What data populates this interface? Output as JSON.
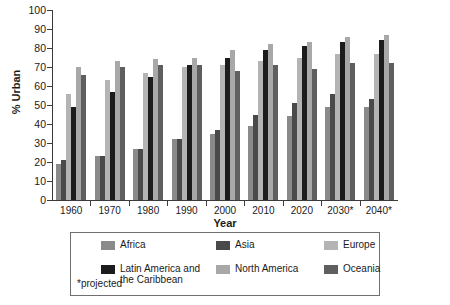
{
  "chart_data": {
    "type": "bar",
    "title": "",
    "subtitle": "",
    "xlabel": "Year",
    "ylabel": "% Urban",
    "ylim": [
      0,
      100
    ],
    "ytick_step": 10,
    "yticks": [
      "100",
      "90",
      "80",
      "70",
      "60",
      "50",
      "40",
      "30",
      "20",
      "10",
      "0"
    ],
    "grid": false,
    "legend_position": "below-boxed",
    "categories": [
      "1960",
      "1970",
      "1980",
      "1990",
      "2000",
      "2010",
      "2020",
      "2030*",
      "2040*"
    ],
    "series": [
      {
        "name": "Africa",
        "color": "#8a8a8a",
        "values": [
          19,
          23,
          27,
          32,
          35,
          39,
          44,
          49,
          49
        ]
      },
      {
        "name": "Asia",
        "color": "#4a4a4a",
        "values": [
          21,
          23,
          27,
          32,
          37,
          45,
          51,
          56,
          53
        ]
      },
      {
        "name": "Europe",
        "color": "#b4b4b4",
        "values": [
          56,
          63,
          67,
          70,
          71,
          73,
          75,
          77,
          77
        ]
      },
      {
        "name": "Latin America and the Caribbean",
        "color": "#1c1c1c",
        "values": [
          49,
          57,
          65,
          71,
          75,
          79,
          81,
          83,
          84
        ]
      },
      {
        "name": "North America",
        "color": "#a8a8a8",
        "values": [
          70,
          73,
          74,
          75,
          79,
          82,
          83,
          86,
          87
        ]
      },
      {
        "name": "Oceania",
        "color": "#5f5f5f",
        "values": [
          66,
          70,
          71,
          71,
          68,
          71,
          69,
          72,
          72
        ]
      }
    ],
    "notes": "*projected"
  },
  "legend": {
    "items": [
      {
        "label": "Africa"
      },
      {
        "label": "Asia"
      },
      {
        "label": "Europe"
      },
      {
        "label": "Latin America and\nthe Caribbean"
      },
      {
        "label": "North America"
      },
      {
        "label": "Oceania"
      }
    ],
    "footnote": "*projected"
  }
}
